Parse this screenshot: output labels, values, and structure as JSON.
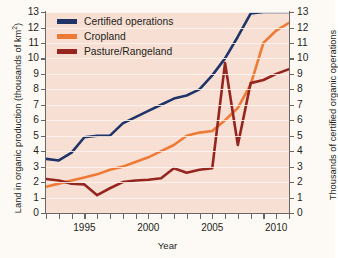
{
  "chart_data": {
    "type": "line",
    "title": "",
    "xlabel": "Year",
    "ylabel": "Land in organic production (thousands of km2)",
    "ylabel_right": "Thousands of certified organic operations",
    "xlim": [
      1992,
      2011
    ],
    "ylim": [
      0,
      13
    ],
    "ylim_right": [
      0,
      13
    ],
    "grid": true,
    "legend_position": "top-left",
    "x": [
      1992,
      1993,
      1994,
      1995,
      1996,
      1997,
      1998,
      1999,
      2000,
      2001,
      2002,
      2003,
      2004,
      2005,
      2006,
      2007,
      2008,
      2009,
      2010,
      2011
    ],
    "xticks": [
      1995,
      2000,
      2005,
      2010
    ],
    "xticklabels": [
      "1995",
      "2000",
      "2005",
      "2010"
    ],
    "yticks": [
      0,
      1,
      2,
      3,
      4,
      5,
      6,
      7,
      8,
      9,
      10,
      11,
      12,
      13
    ],
    "yticklabels": [
      "0",
      "1",
      "2",
      "3",
      "4",
      "5",
      "6",
      "7",
      "8",
      "9",
      "10",
      "11",
      "12",
      "13"
    ],
    "series": [
      {
        "name": "Certified operations",
        "color": "#1f3468",
        "axis": "right",
        "values": [
          3.5,
          3.4,
          3.9,
          4.9,
          5.0,
          5.0,
          5.8,
          6.2,
          6.6,
          7.0,
          7.4,
          7.6,
          8.0,
          8.9,
          10.0,
          11.4,
          12.9,
          13.0,
          13.0,
          13.0
        ]
      },
      {
        "name": "Cropland",
        "color": "#ef7a35",
        "axis": "left",
        "values": [
          1.7,
          1.9,
          2.1,
          2.3,
          2.5,
          2.8,
          3.0,
          3.3,
          3.6,
          4.0,
          4.4,
          5.0,
          5.2,
          5.3,
          6.0,
          6.8,
          8.3,
          11.0,
          11.8,
          12.3
        ]
      },
      {
        "name": "Pasture/Rangeland",
        "color": "#95261f",
        "axis": "left",
        "values": [
          2.2,
          2.1,
          1.9,
          1.85,
          1.15,
          1.6,
          2.0,
          2.1,
          2.15,
          2.25,
          2.9,
          2.6,
          2.8,
          2.9,
          9.7,
          4.4,
          8.4,
          8.6,
          9.0,
          9.3
        ]
      }
    ]
  },
  "legend": {
    "items": [
      {
        "label": "Certified operations",
        "color": "#1f3468"
      },
      {
        "label": "Cropland",
        "color": "#ef7a35"
      },
      {
        "label": "Pasture/Rangeland",
        "color": "#95261f"
      }
    ]
  },
  "axes": {
    "left_title_main": "Land in organic production (thousands of km",
    "left_title_sup": "2",
    "left_title_end": ")",
    "right_title": "Thousands of certified organic operations",
    "x_title": "Year"
  },
  "colors": {
    "plot_background": "#f7dfd4",
    "page_background": "#fdfaf6",
    "axis": "#6b6664",
    "gridline": "#fdf4ee",
    "text": "#231f20"
  }
}
